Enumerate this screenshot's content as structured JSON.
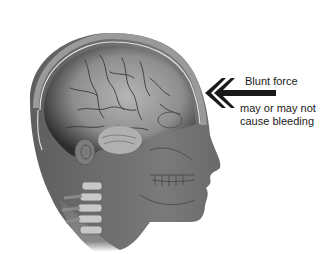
{
  "illustration": {
    "subject": "head-cross-section-with-brain",
    "colors": {
      "background": "#ffffff",
      "skin": "#6f6f6f",
      "skull": "#8a8a8a",
      "brain": "#9a9a9a",
      "brain_dark": "#3a3a3a",
      "arrow": "#1a1a1a",
      "text": "#1a1a1a"
    }
  },
  "annotation": {
    "arrow_icon": "double-chevron-left-arrow",
    "title": "Blunt force",
    "subtitle_line1": "may or may not",
    "subtitle_line2": "cause bleeding"
  }
}
